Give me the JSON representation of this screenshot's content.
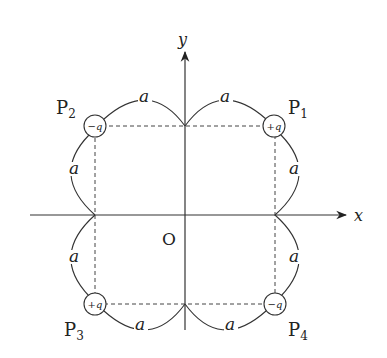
{
  "axes": {
    "x_label": "x",
    "y_label": "y",
    "origin_label": "O"
  },
  "side_label": "a",
  "points": [
    {
      "name": "P",
      "sub": "1",
      "charge": "+q"
    },
    {
      "name": "P",
      "sub": "2",
      "charge": "−q"
    },
    {
      "name": "P",
      "sub": "3",
      "charge": "+q"
    },
    {
      "name": "P",
      "sub": "4",
      "charge": "−q"
    }
  ],
  "colors": {
    "line": "#333333",
    "background": "#ffffff"
  }
}
